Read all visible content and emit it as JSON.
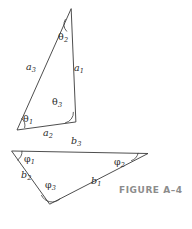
{
  "figure": {
    "caption": "FIGURE A–4",
    "caption_color": "#8c8c8c",
    "stroke_color": "#3a3a3a",
    "label_color": "#2b2b2b",
    "background": "#ffffff",
    "width": 192,
    "height": 229
  },
  "triangles": [
    {
      "id": "upper-triangle",
      "name": "triangle-a",
      "vertices": [
        {
          "name": "apex",
          "x": 71,
          "y": 9
        },
        {
          "name": "bottom-left",
          "x": 17,
          "y": 130
        },
        {
          "name": "bottom-right",
          "x": 75.5,
          "y": 122
        }
      ],
      "sides": [
        {
          "label": "a",
          "sub": "1",
          "x": 74,
          "y": 63,
          "name": "side-a1"
        },
        {
          "label": "a",
          "sub": "2",
          "x": 43,
          "y": 128,
          "name": "side-a2"
        },
        {
          "label": "a",
          "sub": "3",
          "x": 26,
          "y": 62,
          "name": "side-a3"
        }
      ],
      "angles": [
        {
          "label": "θ",
          "sub": "1",
          "x": 23,
          "y": 114,
          "name": "angle-theta1"
        },
        {
          "label": "θ",
          "sub": "2",
          "x": 58,
          "y": 32,
          "name": "angle-theta2"
        },
        {
          "label": "θ",
          "sub": "3",
          "x": 52,
          "y": 97,
          "name": "angle-theta3"
        }
      ]
    },
    {
      "id": "lower-triangle",
      "name": "triangle-b",
      "vertices": [
        {
          "name": "left",
          "x": 12,
          "y": 151
        },
        {
          "name": "right",
          "x": 148,
          "y": 153.5
        },
        {
          "name": "bottom",
          "x": 50,
          "y": 204
        }
      ],
      "sides": [
        {
          "label": "b",
          "sub": "1",
          "x": 91,
          "y": 176,
          "name": "side-b1"
        },
        {
          "label": "b",
          "sub": "2",
          "x": 21,
          "y": 170,
          "name": "side-b2"
        },
        {
          "label": "b",
          "sub": "3",
          "x": 71,
          "y": 136,
          "name": "side-b3"
        }
      ],
      "angles": [
        {
          "label": "φ",
          "sub": "1",
          "x": 24,
          "y": 154,
          "name": "angle-phi1"
        },
        {
          "label": "φ",
          "sub": "2",
          "x": 114,
          "y": 157,
          "name": "angle-phi2"
        },
        {
          "label": "φ",
          "sub": "3",
          "x": 45,
          "y": 180,
          "name": "angle-phi3"
        }
      ]
    }
  ]
}
